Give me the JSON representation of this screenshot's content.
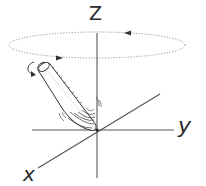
{
  "diagram": {
    "axes": {
      "z_label": "Z",
      "y_label": "y",
      "x_label": "x"
    },
    "precession_orbit": {
      "style": "dotted ellipse",
      "arrows": [
        "top: pointing left",
        "bottom: pointing right"
      ]
    },
    "top": {
      "description": "cone-shaped spinning top tilted from origin",
      "spin_arrow": "curved arrow near top end"
    },
    "colors": {
      "stroke": "#3a3a3a",
      "axis": "#555555",
      "dotted": "#8a8a8a",
      "background": "#ffffff"
    }
  }
}
